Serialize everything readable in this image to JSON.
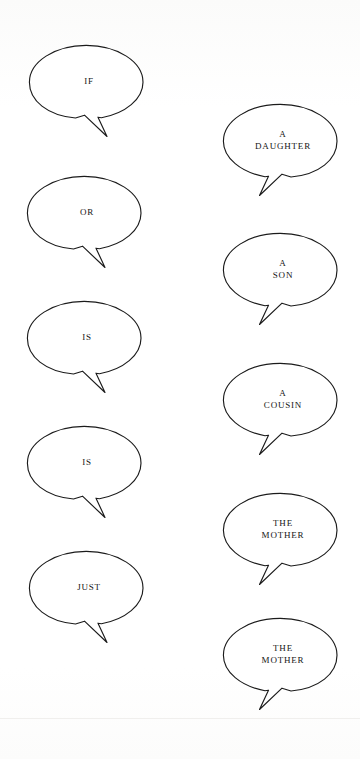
{
  "page": {
    "width": 360,
    "height": 759,
    "background_color": "#fdfdfc",
    "ink_color": "#1b1b1b",
    "text_color": "#141414"
  },
  "balloons": [
    {
      "id": "if",
      "column": "left",
      "order": 1,
      "text": "IF",
      "tail_direction": "down-left",
      "ellipse": {
        "cx": 58,
        "cy": 38,
        "rx": 57,
        "ry": 37
      }
    },
    {
      "id": "a-daughter",
      "column": "right",
      "order": 1,
      "text": "A\nDAUGHTER",
      "tail_direction": "down-left",
      "ellipse": {
        "cx": 58,
        "cy": 38,
        "rx": 57,
        "ry": 37
      }
    },
    {
      "id": "or",
      "column": "left",
      "order": 2,
      "text": "OR",
      "tail_direction": "down-left",
      "ellipse": {
        "cx": 58,
        "cy": 38,
        "rx": 57,
        "ry": 37
      }
    },
    {
      "id": "a-son",
      "column": "right",
      "order": 2,
      "text": "A\nSON",
      "tail_direction": "down-left",
      "ellipse": {
        "cx": 58,
        "cy": 38,
        "rx": 57,
        "ry": 37
      }
    },
    {
      "id": "is-1",
      "column": "left",
      "order": 3,
      "text": "IS",
      "tail_direction": "down-left",
      "ellipse": {
        "cx": 58,
        "cy": 38,
        "rx": 57,
        "ry": 37
      }
    },
    {
      "id": "a-cousin",
      "column": "right",
      "order": 3,
      "text": "A\nCOUSIN",
      "tail_direction": "down-left",
      "ellipse": {
        "cx": 58,
        "cy": 38,
        "rx": 57,
        "ry": 37
      }
    },
    {
      "id": "is-2",
      "column": "left",
      "order": 4,
      "text": "IS",
      "tail_direction": "down-left",
      "ellipse": {
        "cx": 58,
        "cy": 38,
        "rx": 57,
        "ry": 37
      }
    },
    {
      "id": "the-mother-1",
      "column": "right",
      "order": 4,
      "text": "THE\nMOTHER",
      "tail_direction": "down-left",
      "ellipse": {
        "cx": 58,
        "cy": 38,
        "rx": 57,
        "ry": 37
      }
    },
    {
      "id": "just",
      "column": "left",
      "order": 5,
      "text": "JUST",
      "tail_direction": "down-left",
      "ellipse": {
        "cx": 58,
        "cy": 38,
        "rx": 57,
        "ry": 37
      }
    },
    {
      "id": "the-mother-2",
      "column": "right",
      "order": 5,
      "text": "THE\nMOTHER",
      "tail_direction": "down-left",
      "ellipse": {
        "cx": 58,
        "cy": 38,
        "rx": 57,
        "ry": 37
      }
    }
  ],
  "reading_order_text": [
    "IF",
    "A DAUGHTER",
    "OR",
    "A SON",
    "IS",
    "A COUSIN",
    "IS",
    "THE MOTHER",
    "JUST",
    "THE MOTHER"
  ]
}
